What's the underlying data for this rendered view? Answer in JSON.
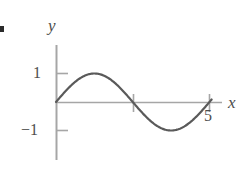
{
  "figure": {
    "bullet": "▪",
    "axis_labels": {
      "x": "x",
      "y": "y"
    },
    "tick_labels": {
      "y_positive": "1",
      "y_negative": "−1",
      "x_five": "5"
    },
    "colors": {
      "curve": "#5a5a5a",
      "axis": "#a6a6a6",
      "tick": "#a6a6a6",
      "text": "#4d4d4d",
      "background": "#ffffff",
      "bullet": "#2b2b2b"
    }
  },
  "chart_data": {
    "type": "line",
    "title": "",
    "xlabel": "x",
    "ylabel": "y",
    "xlim": [
      0,
      5.5
    ],
    "ylim": [
      -1.45,
      1.5
    ],
    "grid": false,
    "legend": null,
    "x_ticks": [
      2.5,
      5
    ],
    "x_tick_labels": [
      "",
      "5"
    ],
    "y_ticks": [
      1,
      -1
    ],
    "y_tick_labels": [
      "1",
      "−1"
    ],
    "series": [
      {
        "name": "sine",
        "expression": "sin(2*pi*x/5)",
        "x": [
          0,
          0.25,
          0.5,
          0.75,
          1,
          1.25,
          1.5,
          1.75,
          2,
          2.25,
          2.5,
          2.75,
          3,
          3.25,
          3.5,
          3.75,
          4,
          4.25,
          4.5,
          4.75,
          5
        ],
        "y": [
          0,
          0.309,
          0.588,
          0.809,
          0.951,
          1,
          0.951,
          0.809,
          0.588,
          0.309,
          0,
          -0.309,
          -0.588,
          -0.809,
          -0.951,
          -1,
          -0.951,
          -0.809,
          -0.588,
          -0.309,
          0
        ]
      }
    ]
  }
}
